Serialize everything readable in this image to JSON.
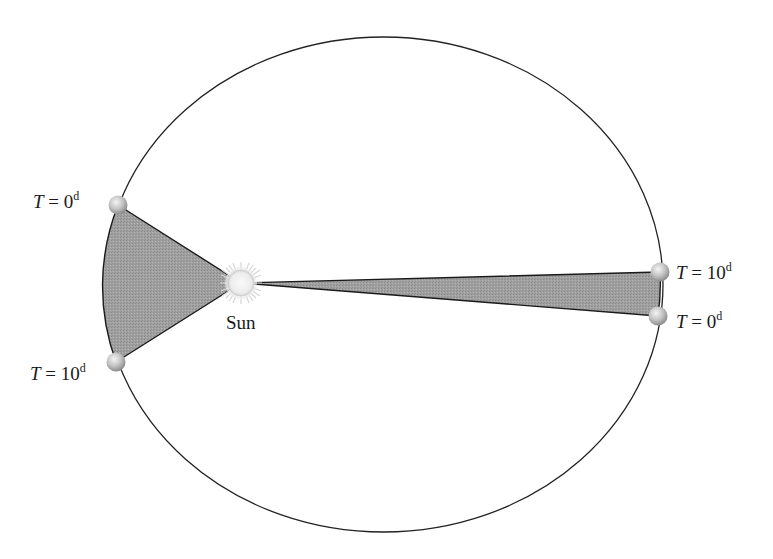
{
  "diagram": {
    "title": "",
    "type": "kepler-second-law-equal-areas",
    "colors": {
      "background": "#ffffff",
      "orbit_stroke": "#222222",
      "swept_area_fill": "#9a9a9a",
      "swept_area_stroke": "#1a1a1a",
      "sun_fill": "#f2f2f2",
      "sun_rays": "#d9d9d9",
      "planet_fill": "#bdbdbd"
    },
    "orbit": {
      "cx": 383.5,
      "cy": 284.5,
      "rx": 279.5,
      "ry": 247.5
    },
    "sun": {
      "label": "Sun",
      "cx": 241,
      "cy": 283,
      "r": 13
    },
    "planets": [
      {
        "id": "left-start",
        "cx": 118,
        "cy": 205,
        "label": {
          "var": "T",
          "eq": " = 0",
          "sup": "d"
        }
      },
      {
        "id": "left-end",
        "cx": 116,
        "cy": 362,
        "label": {
          "var": "T",
          "eq": " = 10",
          "sup": "d"
        }
      },
      {
        "id": "right-end",
        "cx": 660,
        "cy": 272,
        "label": {
          "var": "T",
          "eq": " = 10",
          "sup": "d"
        }
      },
      {
        "id": "right-start",
        "cx": 658,
        "cy": 316,
        "label": {
          "var": "T",
          "eq": " = 0",
          "sup": "d"
        }
      }
    ],
    "swept_areas": [
      {
        "id": "near-perihelion",
        "note": "wide short sector near Sun"
      },
      {
        "id": "near-aphelion",
        "note": "narrow long sector far from Sun"
      }
    ]
  }
}
